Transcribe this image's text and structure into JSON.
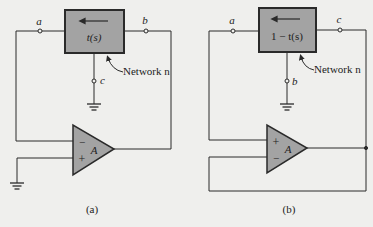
{
  "figure": {
    "background": "#efefed",
    "block_fill": "#a3a3a3",
    "line_color": "#2a2a2a",
    "panels": [
      {
        "id": "a",
        "caption": "(a)",
        "block_label": "t(s)",
        "block_arrow": "left",
        "network_label": "Network n",
        "terminals": {
          "left": "a",
          "right": "b",
          "bottom": "c"
        },
        "opamp": {
          "gain": "A",
          "top_input": "−",
          "bottom_input": "+"
        }
      },
      {
        "id": "b",
        "caption": "(b)",
        "block_label": "1 − t(s)",
        "block_arrow": "left",
        "network_label": "Network n",
        "terminals": {
          "left": "a",
          "right": "c",
          "bottom": "b"
        },
        "opamp": {
          "gain": "A",
          "top_input": "+",
          "bottom_input": "−"
        }
      }
    ]
  }
}
